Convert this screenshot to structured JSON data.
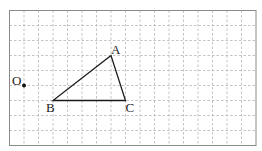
{
  "grid": {
    "columns": 17,
    "rows": 9,
    "origin_x": 9.5,
    "origin_y": 10.5,
    "cell_w": 14.5,
    "cell_h": 15,
    "border_color": "#8a8a8a",
    "grid_color": "#b5b5b5"
  },
  "points": {
    "O": {
      "label": "O",
      "col": 1,
      "row": 5
    },
    "A": {
      "label": "A",
      "col": 7,
      "row": 3
    },
    "B": {
      "label": "B",
      "col": 3,
      "row": 6
    },
    "C": {
      "label": "C",
      "col": 8,
      "row": 6
    }
  },
  "triangle": {
    "vertices": [
      "A",
      "B",
      "C"
    ],
    "stroke": "#1a1a1a"
  }
}
